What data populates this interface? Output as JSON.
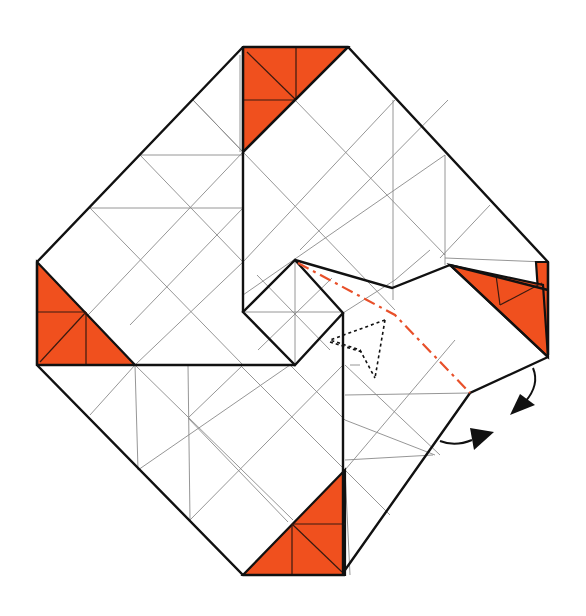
{
  "diagram": {
    "type": "origami-fold-step",
    "colors": {
      "paper_white": "#ffffff",
      "paper_colored": "#f0501e",
      "edge": "#111111",
      "crease": "#8a8a8a",
      "valley_fold_line": "#e8502a"
    },
    "elements": {
      "colored_corners": [
        "top",
        "left",
        "bottom",
        "right"
      ],
      "center_square": "small diamond with 8-way crease lines",
      "valley_fold": "red dash-dot line from center point to right flap edge",
      "hidden_arrow": "dotted arrow showing flap folding inward",
      "rotation_arrows": "two curved black arrows indicating the flap swings"
    }
  }
}
